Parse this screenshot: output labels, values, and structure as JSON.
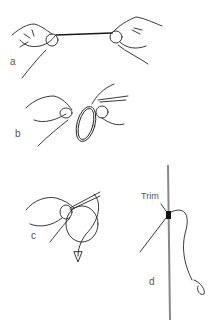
{
  "figure": {
    "panels": [
      {
        "id": "a",
        "label": "a"
      },
      {
        "id": "b",
        "label": "b"
      },
      {
        "id": "c",
        "label": "c"
      },
      {
        "id": "d",
        "label": "d",
        "annotation": "Trim"
      }
    ],
    "colors": {
      "ink": "#222222",
      "rod": "#888888",
      "label": "#555555",
      "background": "#ffffff"
    }
  }
}
